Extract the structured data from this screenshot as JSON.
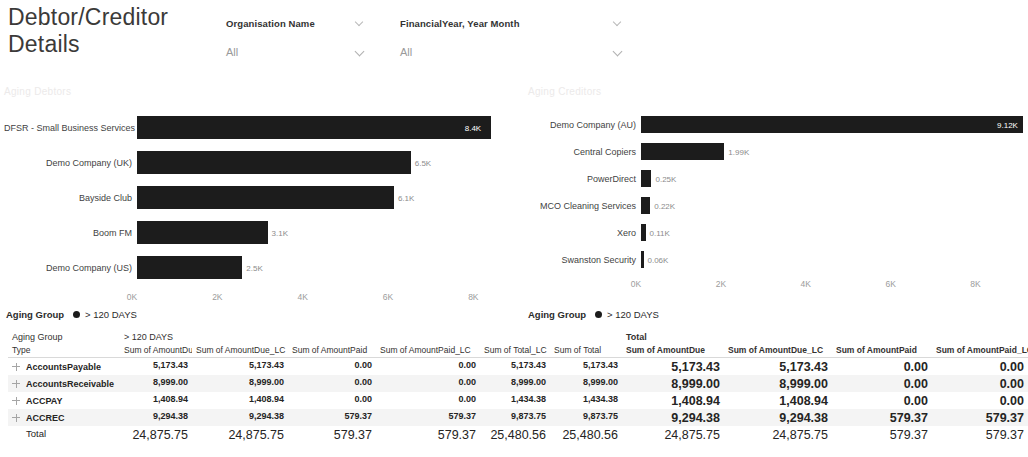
{
  "report": {
    "title": "Debtor/Creditor Details"
  },
  "slicers": [
    {
      "name": "organisation-name",
      "header": "Organisation Name",
      "value": "All",
      "chevron": "chevron-down-icon"
    },
    {
      "name": "financial-year",
      "header": "FinancialYear, Year Month",
      "value": "All",
      "chevron": "chevron-down-icon"
    }
  ],
  "legends": {
    "debtors": {
      "field": "Aging Group",
      "category": "> 120 DAYS"
    },
    "creditors": {
      "field": "Aging Group",
      "category": "> 120 DAYS"
    }
  },
  "chart_data": [
    {
      "type": "bar",
      "orientation": "horizontal",
      "title": "Aging Debtors",
      "xlabel": "",
      "ylabel": "",
      "xlim": [
        0,
        9
      ],
      "ticks": [
        "0K",
        "2K",
        "4K",
        "6K",
        "8K"
      ],
      "tick_values": [
        0,
        2,
        4,
        6,
        8
      ],
      "grid": false,
      "legend": "Aging Group  > 120 DAYS",
      "categories": [
        "DFSR - Small Business Services",
        "Demo Company (UK)",
        "Bayside Club",
        "Boom FM",
        "Demo Company (US)"
      ],
      "values": [
        8.4,
        6.5,
        6.1,
        3.1,
        2.5
      ],
      "labels": [
        "8.4K",
        "6.5K",
        "6.1K",
        "3.1K",
        "2.5K"
      ]
    },
    {
      "type": "bar",
      "orientation": "horizontal",
      "title": "Aging Creditors",
      "xlabel": "",
      "ylabel": "",
      "xlim": [
        0,
        9
      ],
      "ticks": [
        "0K",
        "2K",
        "4K",
        "6K",
        "8K"
      ],
      "tick_values": [
        0,
        2,
        4,
        6,
        8
      ],
      "grid": false,
      "legend": "Aging Group  > 120 DAYS",
      "categories": [
        "Demo Company (AU)",
        "Central Copiers",
        "PowerDirect",
        "MCO Cleaning Services",
        "Xero",
        "Swanston Security"
      ],
      "values": [
        9.12,
        1.99,
        0.25,
        0.22,
        0.11,
        0.06
      ],
      "labels": [
        "9.12K",
        "1.99K",
        "0.25K",
        "0.22K",
        "0.11K",
        "0.06K"
      ]
    }
  ],
  "matrix": {
    "row_header_top": "Aging Group",
    "row_header_bottom": "Type",
    "group_headers": [
      {
        "label": "> 120 DAYS",
        "bold": false
      },
      {
        "label": "Total",
        "bold": true
      }
    ],
    "columns": [
      "Sum of AmountDue",
      "Sum of AmountDue_LC",
      "Sum of AmountPaid",
      "Sum of AmountPaid_LC",
      "Sum of Total_LC",
      "Sum of Total",
      "Sum of AmountDue",
      "Sum of AmountDue_LC",
      "Sum of AmountPaid",
      "Sum of AmountPaid_LC"
    ],
    "rows": [
      {
        "label": "AccountsPayable",
        "icon": "expand-plus-icon",
        "cells": [
          "5,173.43",
          "5,173.43",
          "0.00",
          "0.00",
          "5,173.43",
          "5,173.43",
          "5,173.43",
          "5,173.43",
          "0.00",
          "0.00"
        ]
      },
      {
        "label": "AccountsReceivable",
        "icon": "expand-plus-icon",
        "cells": [
          "8,999.00",
          "8,999.00",
          "0.00",
          "0.00",
          "8,999.00",
          "8,999.00",
          "8,999.00",
          "8,999.00",
          "0.00",
          "0.00"
        ]
      },
      {
        "label": "ACCPAY",
        "icon": "expand-plus-icon",
        "cells": [
          "1,408.94",
          "1,408.94",
          "0.00",
          "0.00",
          "1,434.38",
          "1,434.38",
          "1,408.94",
          "1,408.94",
          "0.00",
          "0.00"
        ]
      },
      {
        "label": "ACCREC",
        "icon": "expand-plus-icon",
        "cells": [
          "9,294.38",
          "9,294.38",
          "579.37",
          "579.37",
          "9,873.75",
          "9,873.75",
          "9,294.38",
          "9,294.38",
          "579.37",
          "579.37"
        ]
      }
    ],
    "total_row": {
      "label": "Total",
      "cells": [
        "24,875.75",
        "24,875.75",
        "579.37",
        "579.37",
        "25,480.56",
        "25,480.56",
        "24,875.75",
        "24,875.75",
        "579.37",
        "579.37"
      ]
    }
  }
}
